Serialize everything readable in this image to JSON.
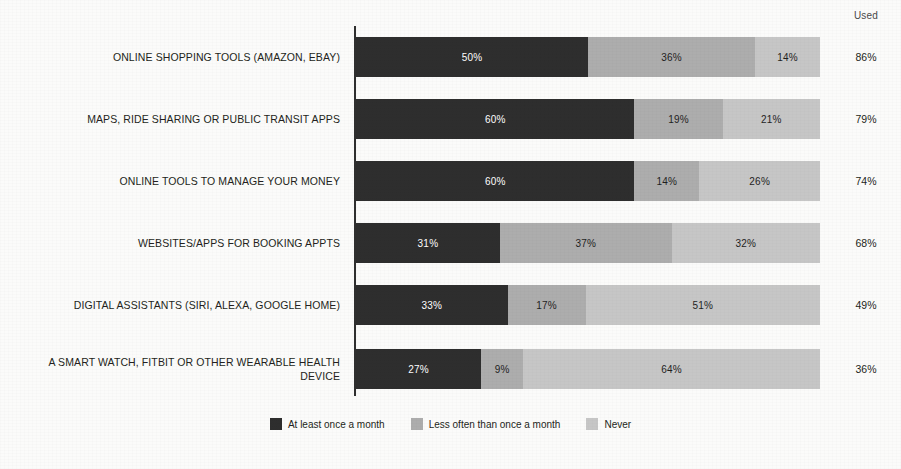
{
  "header": {
    "used_column_label": "Used"
  },
  "legend": {
    "items": [
      {
        "label": "At least once a month",
        "color": "#2e2e2e",
        "swatch_name": "legend-swatch-at-least-once-a-month"
      },
      {
        "label": "Less often than once a month",
        "color": "#adadad",
        "swatch_name": "legend-swatch-less-often-than-once-a-month"
      },
      {
        "label": "Never",
        "color": "#c6c6c6",
        "swatch_name": "legend-swatch-never"
      }
    ]
  },
  "rows": [
    {
      "label": "ONLINE SHOPPING TOOLS (AMAZON, EBAY)",
      "segments": [
        {
          "text": "50%"
        },
        {
          "text": "36%"
        },
        {
          "text": "14%"
        }
      ],
      "used": "86%"
    },
    {
      "label": "MAPS, RIDE SHARING OR PUBLIC TRANSIT APPS",
      "segments": [
        {
          "text": "60%"
        },
        {
          "text": "19%"
        },
        {
          "text": "21%"
        }
      ],
      "used": "79%"
    },
    {
      "label": "ONLINE TOOLS TO MANAGE YOUR MONEY",
      "segments": [
        {
          "text": "60%"
        },
        {
          "text": "14%"
        },
        {
          "text": "26%"
        }
      ],
      "used": "74%"
    },
    {
      "label": "WEBSITES/APPS FOR BOOKING APPTS",
      "segments": [
        {
          "text": "31%"
        },
        {
          "text": "37%"
        },
        {
          "text": "32%"
        }
      ],
      "used": "68%"
    },
    {
      "label": "DIGITAL ASSISTANTS (SIRI, ALEXA, GOOGLE HOME)",
      "segments": [
        {
          "text": "33%"
        },
        {
          "text": "17%"
        },
        {
          "text": "51%"
        }
      ],
      "used": "49%"
    },
    {
      "label": "A SMART WATCH, FITBIT OR OTHER WEARABLE HEALTH DEVICE",
      "segments": [
        {
          "text": "27%"
        },
        {
          "text": "9%"
        },
        {
          "text": "64%"
        }
      ],
      "used": "36%"
    }
  ],
  "chart_data": {
    "type": "bar",
    "orientation": "horizontal",
    "stacked": true,
    "stack_total": 100,
    "title": "",
    "subtitle": "",
    "xlabel": "",
    "ylabel": "",
    "xlim": [
      0,
      100
    ],
    "grid": false,
    "legend_position": "bottom-center",
    "value_suffix": "%",
    "extra_column": {
      "header": "Used",
      "values": [
        86,
        79,
        74,
        68,
        49,
        36
      ]
    },
    "categories": [
      "ONLINE SHOPPING TOOLS (AMAZON, EBAY)",
      "MAPS, RIDE SHARING OR PUBLIC TRANSIT APPS",
      "ONLINE TOOLS TO MANAGE YOUR MONEY",
      "WEBSITES/APPS FOR BOOKING APPTS",
      "DIGITAL ASSISTANTS (SIRI, ALEXA, GOOGLE HOME)",
      "A SMART WATCH, FITBIT OR OTHER WEARABLE HEALTH DEVICE"
    ],
    "series": [
      {
        "name": "At least once a month",
        "color": "#2e2e2e",
        "values": [
          50,
          60,
          60,
          31,
          33,
          27
        ]
      },
      {
        "name": "Less often than once a month",
        "color": "#adadad",
        "values": [
          36,
          19,
          14,
          37,
          17,
          9
        ]
      },
      {
        "name": "Never",
        "color": "#c6c6c6",
        "values": [
          14,
          21,
          26,
          32,
          51,
          64
        ]
      }
    ]
  }
}
